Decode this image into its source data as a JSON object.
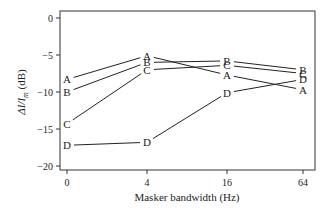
{
  "chart_data": {
    "type": "line",
    "title": "",
    "xlabel": "Masker bandwidth (Hz)",
    "ylabel": "ΔI/I_m (dB)",
    "categories": [
      "0",
      "4",
      "16",
      "64"
    ],
    "ylim": [
      -21,
      2
    ],
    "yticks": [
      0,
      -5,
      -10,
      -15,
      -20
    ],
    "grid": false,
    "legend": "inline point labels",
    "series": [
      {
        "name": "A",
        "values": [
          -8.3,
          -5.1,
          -7.7,
          -9.7
        ]
      },
      {
        "name": "B",
        "values": [
          -10.0,
          -6.0,
          -5.8,
          -7.0
        ]
      },
      {
        "name": "C",
        "values": [
          -14.3,
          -7.0,
          -6.4,
          -7.5
        ]
      },
      {
        "name": "D",
        "values": [
          -17.2,
          -16.8,
          -10.1,
          -8.3
        ]
      }
    ]
  },
  "axes": {
    "x_label": "Masker bandwidth (Hz)",
    "y_label_main": "ΔI/I",
    "y_label_sub": "m",
    "y_label_unit": " (dB)",
    "x_ticks": [
      "0",
      "4",
      "16",
      "64"
    ],
    "y_ticks": [
      "0",
      "−5",
      "−10",
      "−15",
      "−20"
    ]
  },
  "colors": {
    "line": "#222222",
    "axis": "#333333",
    "background": "#ffffff"
  }
}
